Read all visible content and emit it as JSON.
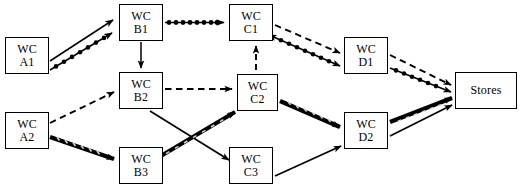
{
  "diagram": {
    "type": "flow-network",
    "background_color": "#ffffff",
    "line_color": "#000000",
    "nodes": [
      {
        "id": "A1",
        "line1": "WC",
        "line2": "A1",
        "x": 5,
        "y": 37,
        "w": 44,
        "h": 37
      },
      {
        "id": "A2",
        "line1": "WC",
        "line2": "A2",
        "x": 5,
        "y": 112,
        "w": 44,
        "h": 37
      },
      {
        "id": "B1",
        "line1": "WC",
        "line2": "B1",
        "x": 119,
        "y": 4,
        "w": 44,
        "h": 37
      },
      {
        "id": "B2",
        "line1": "WC",
        "line2": "B2",
        "x": 119,
        "y": 72,
        "w": 44,
        "h": 37
      },
      {
        "id": "B3",
        "line1": "WC",
        "line2": "B3",
        "x": 119,
        "y": 147,
        "w": 44,
        "h": 37
      },
      {
        "id": "C1",
        "line1": "WC",
        "line2": "C1",
        "x": 229,
        "y": 4,
        "w": 44,
        "h": 37
      },
      {
        "id": "C2",
        "line1": "WC",
        "line2": "C2",
        "x": 237,
        "y": 74,
        "w": 41,
        "h": 37
      },
      {
        "id": "C3",
        "line1": "WC",
        "line2": "C3",
        "x": 229,
        "y": 147,
        "w": 44,
        "h": 37
      },
      {
        "id": "D1",
        "line1": "WC",
        "line2": "D1",
        "x": 344,
        "y": 37,
        "w": 44,
        "h": 37
      },
      {
        "id": "D2",
        "line1": "WC",
        "line2": "D2",
        "x": 344,
        "y": 112,
        "w": 44,
        "h": 37
      },
      {
        "id": "Stores",
        "line1": "Stores",
        "line2": "",
        "x": 455,
        "y": 72,
        "w": 62,
        "h": 37
      }
    ],
    "edges": [
      {
        "id": "a1-b1-solid",
        "from": "A1",
        "to": "B1",
        "style": "solid",
        "arrows": "end"
      },
      {
        "id": "a1-b1-beaded",
        "from": "A1",
        "to": "B1",
        "style": "beaded",
        "arrows": "end"
      },
      {
        "id": "b1-c1",
        "from": "B1",
        "to": "C1",
        "style": "beaded",
        "arrows": "end"
      },
      {
        "id": "b1-b2",
        "from": "B1",
        "to": "B2",
        "style": "solid",
        "arrows": "end"
      },
      {
        "id": "c1-d1-dashed",
        "from": "C1",
        "to": "D1",
        "style": "dashed",
        "arrows": "end"
      },
      {
        "id": "c1-d1-beaded",
        "from": "C1",
        "to": "D1",
        "style": "beaded",
        "arrows": "both"
      },
      {
        "id": "d1-stores-das",
        "from": "D1",
        "to": "Stores",
        "style": "dashed",
        "arrows": "end"
      },
      {
        "id": "d1-stores-bea",
        "from": "D1",
        "to": "Stores",
        "style": "beaded",
        "arrows": "end"
      },
      {
        "id": "a2-b2",
        "from": "A2",
        "to": "B2",
        "style": "dashed",
        "arrows": "end"
      },
      {
        "id": "a2-b3",
        "from": "A2",
        "to": "B3",
        "style": "hatched",
        "arrows": "end"
      },
      {
        "id": "b2-c2",
        "from": "B2",
        "to": "C2",
        "style": "dashed",
        "arrows": "end"
      },
      {
        "id": "c2-c1",
        "from": "C2",
        "to": "C1",
        "style": "dashed",
        "arrows": "end"
      },
      {
        "id": "b2-c3",
        "from": "B2",
        "to": "C3",
        "style": "solid",
        "arrows": "end"
      },
      {
        "id": "b3-c2",
        "from": "B3",
        "to": "C2",
        "style": "hatched",
        "arrows": "both"
      },
      {
        "id": "c2-d2",
        "from": "C2",
        "to": "D2",
        "style": "hatched",
        "arrows": "end"
      },
      {
        "id": "c3-d2",
        "from": "C3",
        "to": "D2",
        "style": "solid",
        "arrows": "end"
      },
      {
        "id": "d2-stores-hat",
        "from": "D2",
        "to": "Stores",
        "style": "hatched",
        "arrows": "end"
      },
      {
        "id": "d2-stores-sol",
        "from": "D2",
        "to": "Stores",
        "style": "solid",
        "arrows": "end"
      }
    ]
  }
}
